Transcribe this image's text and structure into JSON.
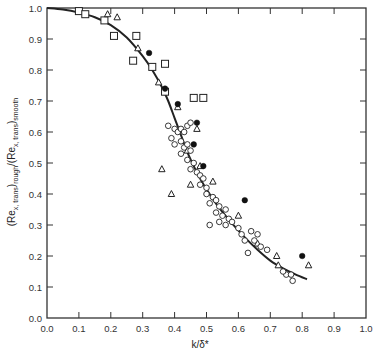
{
  "chart_data": {
    "type": "scatter",
    "title": "",
    "xlabel": "k/δ*",
    "ylabel": {
      "prefix": "(Re",
      "sub1": "x, trans",
      "mid": ")",
      "sub2": "rough",
      "mid2": "/(Re",
      "sub3": "x, trans",
      "mid3": ")",
      "sub4": "smooth"
    },
    "xlim": [
      0.0,
      1.0
    ],
    "ylim": [
      0.0,
      1.0
    ],
    "xticks": [
      "0.0",
      "0.1",
      "0.2",
      "0.3",
      "0.4",
      "0.5",
      "0.6",
      "0.7",
      "0.8",
      "0.9",
      "1.0"
    ],
    "yticks": [
      "0.0",
      "0.1",
      "0.2",
      "0.3",
      "0.4",
      "0.5",
      "0.6",
      "0.7",
      "0.8",
      "0.9",
      "1.0"
    ],
    "grid": false,
    "legend": "none",
    "series": [
      {
        "name": "squares",
        "marker": "square-open",
        "points": [
          [
            0.1,
            0.99
          ],
          [
            0.12,
            0.98
          ],
          [
            0.18,
            0.96
          ],
          [
            0.21,
            0.91
          ],
          [
            0.28,
            0.91
          ],
          [
            0.27,
            0.83
          ],
          [
            0.33,
            0.81
          ],
          [
            0.37,
            0.82
          ],
          [
            0.37,
            0.73
          ],
          [
            0.46,
            0.71
          ],
          [
            0.49,
            0.71
          ]
        ]
      },
      {
        "name": "triangles",
        "marker": "triangle-open",
        "points": [
          [
            0.19,
            0.98
          ],
          [
            0.22,
            0.97
          ],
          [
            0.285,
            0.87
          ],
          [
            0.35,
            0.76
          ],
          [
            0.41,
            0.68
          ],
          [
            0.47,
            0.61
          ],
          [
            0.36,
            0.48
          ],
          [
            0.39,
            0.4
          ],
          [
            0.44,
            0.54
          ],
          [
            0.48,
            0.49
          ],
          [
            0.52,
            0.44
          ],
          [
            0.6,
            0.33
          ],
          [
            0.72,
            0.2
          ],
          [
            0.725,
            0.17
          ],
          [
            0.82,
            0.17
          ],
          [
            0.45,
            0.43
          ],
          [
            0.66,
            0.24
          ]
        ]
      },
      {
        "name": "filled-circles",
        "marker": "circle-filled",
        "points": [
          [
            0.32,
            0.855
          ],
          [
            0.37,
            0.74
          ],
          [
            0.41,
            0.69
          ],
          [
            0.47,
            0.63
          ],
          [
            0.46,
            0.56
          ],
          [
            0.49,
            0.49
          ],
          [
            0.62,
            0.38
          ],
          [
            0.8,
            0.2
          ]
        ]
      },
      {
        "name": "open-circles",
        "marker": "circle-open",
        "points": [
          [
            0.38,
            0.62
          ],
          [
            0.4,
            0.61
          ],
          [
            0.41,
            0.6
          ],
          [
            0.42,
            0.61
          ],
          [
            0.43,
            0.6
          ],
          [
            0.44,
            0.62
          ],
          [
            0.45,
            0.63
          ],
          [
            0.39,
            0.58
          ],
          [
            0.4,
            0.56
          ],
          [
            0.42,
            0.57
          ],
          [
            0.43,
            0.55
          ],
          [
            0.44,
            0.56
          ],
          [
            0.45,
            0.54
          ],
          [
            0.42,
            0.53
          ],
          [
            0.44,
            0.51
          ],
          [
            0.46,
            0.5
          ],
          [
            0.45,
            0.48
          ],
          [
            0.47,
            0.47
          ],
          [
            0.48,
            0.46
          ],
          [
            0.49,
            0.45
          ],
          [
            0.48,
            0.43
          ],
          [
            0.5,
            0.42
          ],
          [
            0.5,
            0.4
          ],
          [
            0.52,
            0.39
          ],
          [
            0.51,
            0.37
          ],
          [
            0.53,
            0.38
          ],
          [
            0.54,
            0.36
          ],
          [
            0.53,
            0.34
          ],
          [
            0.55,
            0.33
          ],
          [
            0.56,
            0.35
          ],
          [
            0.54,
            0.31
          ],
          [
            0.57,
            0.32
          ],
          [
            0.51,
            0.3
          ],
          [
            0.56,
            0.3
          ],
          [
            0.58,
            0.31
          ],
          [
            0.6,
            0.29
          ],
          [
            0.61,
            0.27
          ],
          [
            0.62,
            0.25
          ],
          [
            0.64,
            0.28
          ],
          [
            0.66,
            0.27
          ],
          [
            0.65,
            0.25
          ],
          [
            0.67,
            0.23
          ],
          [
            0.69,
            0.22
          ],
          [
            0.63,
            0.21
          ],
          [
            0.75,
            0.14
          ],
          [
            0.765,
            0.14
          ],
          [
            0.77,
            0.12
          ],
          [
            0.74,
            0.15
          ]
        ]
      }
    ],
    "curve": {
      "name": "correlation",
      "points": [
        [
          0.0,
          1.0
        ],
        [
          0.05,
          0.995
        ],
        [
          0.1,
          0.985
        ],
        [
          0.15,
          0.97
        ],
        [
          0.2,
          0.945
        ],
        [
          0.25,
          0.905
        ],
        [
          0.3,
          0.845
        ],
        [
          0.33,
          0.8
        ],
        [
          0.36,
          0.745
        ],
        [
          0.38,
          0.7
        ],
        [
          0.4,
          0.645
        ],
        [
          0.42,
          0.59
        ],
        [
          0.44,
          0.535
        ],
        [
          0.46,
          0.49
        ],
        [
          0.48,
          0.45
        ],
        [
          0.5,
          0.415
        ],
        [
          0.54,
          0.355
        ],
        [
          0.58,
          0.305
        ],
        [
          0.62,
          0.26
        ],
        [
          0.66,
          0.22
        ],
        [
          0.7,
          0.185
        ],
        [
          0.74,
          0.16
        ],
        [
          0.78,
          0.14
        ],
        [
          0.815,
          0.125
        ]
      ]
    }
  }
}
